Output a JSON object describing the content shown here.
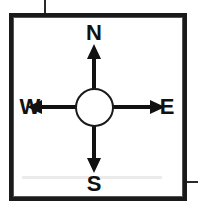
{
  "figure": {
    "type": "compass-rose-diagram",
    "background_color": "#ffffff",
    "ink_color": "#111111",
    "frame": {
      "outer_border_color": "#1a1a1a",
      "inner_border_color": "#555555"
    }
  },
  "compass": {
    "hub": {
      "shape": "circle",
      "fill": "#ffffff",
      "stroke": "#1a1a1a"
    },
    "directions": [
      {
        "key": "north",
        "label": "N",
        "bearing": "0",
        "arrow": "arrow-up-icon"
      },
      {
        "key": "east",
        "label": "E",
        "bearing": "90",
        "arrow": "arrow-right-icon"
      },
      {
        "key": "south",
        "label": "S",
        "bearing": "180",
        "arrow": "arrow-down-icon"
      },
      {
        "key": "west",
        "label": "W",
        "bearing": "270",
        "arrow": "arrow-left-icon"
      }
    ]
  }
}
